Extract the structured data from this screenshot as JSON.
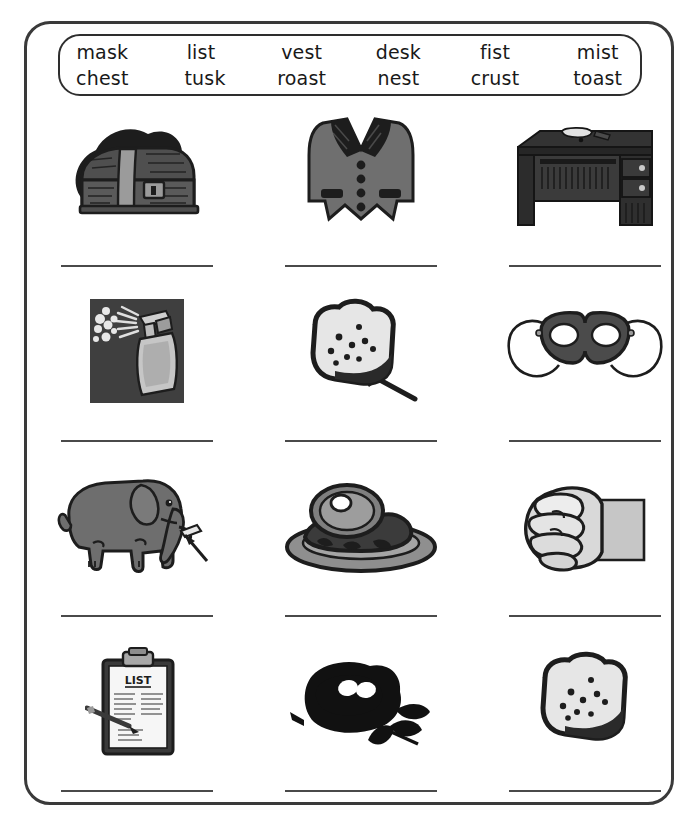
{
  "worksheet": {
    "title": "Word bank picture-matching worksheet",
    "word_bank": {
      "name": "word-bank",
      "rows": [
        [
          "mask",
          "list",
          "vest",
          "desk",
          "fist",
          "mist"
        ],
        [
          "chest",
          "tusk",
          "roast",
          "nest",
          "crust",
          "toast"
        ]
      ]
    },
    "grid": {
      "columns": 3,
      "rows": 4,
      "cells": [
        {
          "picture": "treasure-chest-image",
          "answer_word": "chest",
          "answer_value": ""
        },
        {
          "picture": "vest-image",
          "answer_word": "vest",
          "answer_value": ""
        },
        {
          "picture": "desk-image",
          "answer_word": "desk",
          "answer_value": ""
        },
        {
          "picture": "spray-bottle-mist-image",
          "answer_word": "mist",
          "answer_value": ""
        },
        {
          "picture": "toast-on-fork-image",
          "answer_word": "toast",
          "answer_value": ""
        },
        {
          "picture": "eye-mask-image",
          "answer_word": "mask",
          "answer_value": ""
        },
        {
          "picture": "elephant-tusk-image",
          "answer_word": "tusk",
          "answer_value": ""
        },
        {
          "picture": "roast-on-platter-image",
          "answer_word": "roast",
          "answer_value": ""
        },
        {
          "picture": "fist-image",
          "answer_word": "fist",
          "answer_value": ""
        },
        {
          "picture": "clipboard-list-image",
          "answer_word": "list",
          "answer_value": ""
        },
        {
          "picture": "birds-nest-image",
          "answer_word": "nest",
          "answer_value": ""
        },
        {
          "picture": "bread-crust-image",
          "answer_word": "crust",
          "answer_value": ""
        }
      ]
    },
    "labels": {
      "clipboard_heading": "LIST"
    },
    "colors": {
      "ink": "#1d1d1d",
      "border": "#3a3a3a",
      "line": "#4a4a4a",
      "paper": "#ffffff",
      "grey_dark": "#4c4c4c",
      "grey_mid": "#7d7d7d",
      "grey_light": "#b9b9b9",
      "grey_pale": "#dddddd"
    }
  }
}
